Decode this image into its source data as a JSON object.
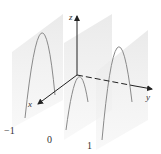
{
  "figure": {
    "axes": {
      "x_label": "x",
      "y_label": "y",
      "z_label": "z"
    },
    "plane_labels": [
      "−1",
      "0",
      "1"
    ],
    "colors": {
      "plane_fill": "#e6e6e6",
      "curve": "#8a8a8a",
      "axis": "#222222",
      "label": "#333333"
    }
  }
}
